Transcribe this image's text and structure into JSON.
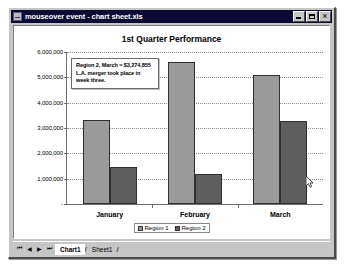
{
  "window": {
    "title": "mouseover event - chart sheet.xls",
    "icon": "excel-chart-icon",
    "controls": {
      "minimize": "minimize",
      "maximize": "maximize",
      "close": "close"
    }
  },
  "tooltip": {
    "lines": [
      "Region 2, March = $3,274,855",
      "L.A. merger took place in",
      "week three."
    ]
  },
  "sheet_tabs": {
    "nav": {
      "first": "⏮",
      "prev": "◀",
      "next": "▶",
      "last": "⏭"
    },
    "tabs": [
      {
        "label": "Chart1",
        "active": true
      },
      {
        "label": "Sheet1",
        "active": false
      }
    ],
    "separator": "/"
  },
  "chart_data": {
    "type": "bar",
    "title": "1st Quarter Performance",
    "xlabel": "",
    "ylabel": "",
    "categories": [
      "January",
      "February",
      "March"
    ],
    "series": [
      {
        "name": "Region 1",
        "color": "#9a9a9a",
        "values": [
          3300000,
          5600000,
          5100000
        ]
      },
      {
        "name": "Region 2",
        "color": "#5e5e5e",
        "values": [
          1450000,
          1200000,
          3274855
        ]
      }
    ],
    "ylim": [
      0,
      6000000
    ],
    "ytick_labels": [
      "6,000,000",
      "5,000,000",
      "4,000,000",
      "3,000,000",
      "2,000,000",
      "1,000,000",
      "-"
    ],
    "ytick_values": [
      6000000,
      5000000,
      4000000,
      3000000,
      2000000,
      1000000,
      0
    ],
    "grid": true,
    "legend_position": "bottom"
  }
}
